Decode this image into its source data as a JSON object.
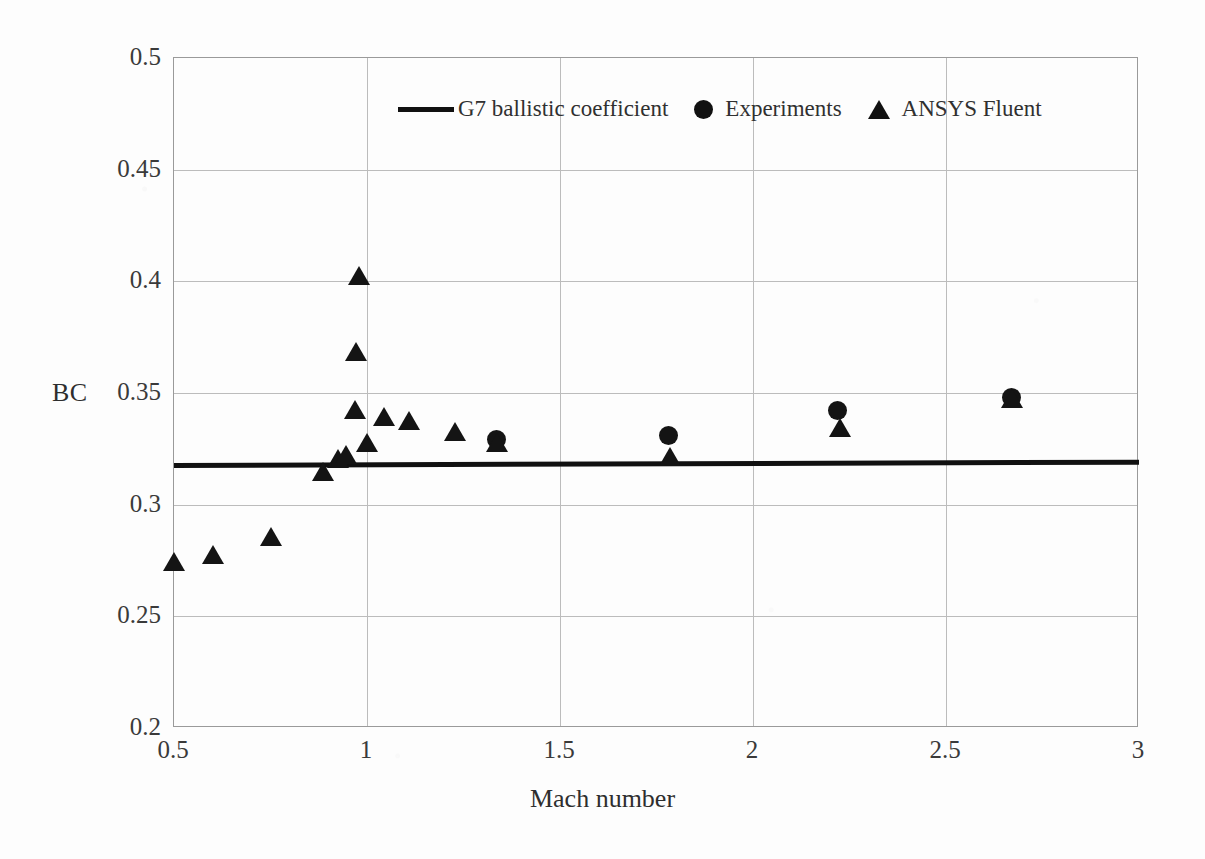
{
  "chart_data": {
    "type": "scatter",
    "title": "",
    "xlabel": "Mach number",
    "ylabel": "BC",
    "xlim": [
      0.5,
      3.0
    ],
    "ylim": [
      0.2,
      0.5
    ],
    "xticks": [
      "0.5",
      "1",
      "1.5",
      "2",
      "2.5",
      "3"
    ],
    "xtick_values": [
      0.5,
      1.0,
      1.5,
      2.0,
      2.5,
      3.0
    ],
    "yticks": [
      "0.2",
      "0.25",
      "0.3",
      "0.35",
      "0.4",
      "0.45",
      "0.5"
    ],
    "ytick_values": [
      0.2,
      0.25,
      0.3,
      0.35,
      0.4,
      0.45,
      0.5
    ],
    "grid": true,
    "legend_position": "top-center-inside",
    "series": [
      {
        "name": "G7 ballistic coefficient",
        "type": "line",
        "marker": "line",
        "color": "#111111",
        "x": [
          0.5,
          3.0
        ],
        "y": [
          0.3175,
          0.319
        ]
      },
      {
        "name": "Experiments",
        "type": "scatter",
        "marker": "circle",
        "color": "#141414",
        "x": [
          1.336,
          1.78,
          2.22,
          2.67
        ],
        "y": [
          0.329,
          0.331,
          0.342,
          0.348
        ]
      },
      {
        "name": "ANSYS Fluent",
        "type": "scatter",
        "marker": "triangle",
        "color": "#141414",
        "x": [
          0.5,
          0.6,
          0.75,
          0.886,
          0.925,
          0.945,
          0.968,
          0.972,
          0.978,
          1.0,
          1.045,
          1.11,
          1.227,
          1.336,
          1.785,
          2.225,
          2.67
        ],
        "y": [
          0.274,
          0.277,
          0.285,
          0.314,
          0.32,
          0.322,
          0.342,
          0.368,
          0.402,
          0.327,
          0.339,
          0.337,
          0.332,
          0.327,
          0.321,
          0.334,
          0.347
        ]
      }
    ]
  },
  "legend": {
    "entries": [
      {
        "label": "G7 ballistic coefficient",
        "marker": "line"
      },
      {
        "label": "Experiments",
        "marker": "circle"
      },
      {
        "label": "ANSYS Fluent",
        "marker": "triangle"
      }
    ]
  },
  "axes": {
    "y_title": "BC",
    "x_title": "Mach number"
  }
}
